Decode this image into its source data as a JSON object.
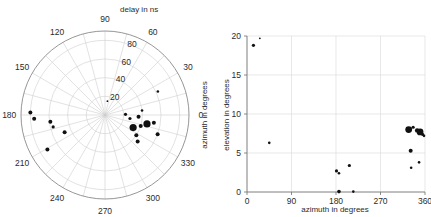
{
  "figure": {
    "background": "#ffffff",
    "marker_color": "#111111",
    "grid_color": "#cfcfcf",
    "axis_color": "#6e6e6e"
  },
  "chart_data": [
    {
      "type": "scatter",
      "projection": "polar",
      "title": "delay in ns",
      "xlabel": "",
      "ylabel": "azimuth in degrees",
      "angle_label": "azimuth in degrees",
      "radial_label": "delay in ns",
      "grid": true,
      "rlim": [
        0,
        90
      ],
      "rticks": [
        20,
        40,
        60,
        80
      ],
      "rtick_labels": [
        "20",
        "40",
        "60",
        "80"
      ],
      "theta_ticks": [
        0,
        30,
        60,
        90,
        120,
        150,
        180,
        210,
        240,
        270,
        300,
        330
      ],
      "theta_tick_labels": [
        "0",
        "30",
        "60",
        "90",
        "120",
        "150",
        "180",
        "210",
        "240",
        "270",
        "300",
        "330"
      ],
      "theta_direction": "counterclockwise",
      "theta_zero_location": "E",
      "points": [
        {
          "theta": 24,
          "r": 62,
          "size": 1.3
        },
        {
          "theta": 7,
          "r": 40,
          "size": 1.3
        },
        {
          "theta": 357,
          "r": 36,
          "size": 2.0
        },
        {
          "theta": 351,
          "r": 53,
          "size": 2.0
        },
        {
          "theta": 348,
          "r": 46,
          "size": 3.6
        },
        {
          "theta": 2,
          "r": 22,
          "size": 1.6
        },
        {
          "theta": 352,
          "r": 27,
          "size": 1.6
        },
        {
          "theta": 343,
          "r": 40,
          "size": 2.0
        },
        {
          "theta": 340,
          "r": 60,
          "size": 2.0
        },
        {
          "theta": 336,
          "r": 33,
          "size": 3.6
        },
        {
          "theta": 327,
          "r": 40,
          "size": 2.0
        },
        {
          "theta": 321,
          "r": 45,
          "size": 2.0
        },
        {
          "theta": 187,
          "r": 59,
          "size": 2.0
        },
        {
          "theta": 183,
          "r": 76,
          "size": 2.0
        },
        {
          "theta": 178,
          "r": 80,
          "size": 2.0
        },
        {
          "theta": 193,
          "r": 57,
          "size": 1.6
        },
        {
          "theta": 203,
          "r": 47,
          "size": 2.0
        },
        {
          "theta": 211,
          "r": 72,
          "size": 2.0
        },
        {
          "theta": 80,
          "r": 15,
          "size": 0.9
        }
      ]
    },
    {
      "type": "scatter",
      "projection": "cartesian",
      "title": "",
      "xlabel": "azimuth in degrees",
      "ylabel": "elevation in degrees",
      "grid": true,
      "xlim": [
        0,
        360
      ],
      "ylim": [
        0,
        20
      ],
      "xticks": [
        0,
        90,
        180,
        270,
        360
      ],
      "xtick_labels": [
        "0",
        "90",
        "180",
        "270",
        "360"
      ],
      "yticks": [
        0,
        5,
        10,
        15,
        20
      ],
      "ytick_labels": [
        "0",
        "5",
        "10",
        "15",
        "20"
      ],
      "points": [
        {
          "x": 13,
          "y": 18.8,
          "size": 1.6
        },
        {
          "x": 26,
          "y": 19.7,
          "size": 0.9
        },
        {
          "x": 45,
          "y": 6.3,
          "size": 1.3
        },
        {
          "x": 181,
          "y": 2.7,
          "size": 1.6
        },
        {
          "x": 186,
          "y": 2.4,
          "size": 1.3
        },
        {
          "x": 186,
          "y": 0.05,
          "size": 1.8
        },
        {
          "x": 207,
          "y": 3.4,
          "size": 1.6
        },
        {
          "x": 215,
          "y": 0.05,
          "size": 1.3
        },
        {
          "x": 327,
          "y": 8.0,
          "size": 3.4
        },
        {
          "x": 336,
          "y": 8.3,
          "size": 1.6
        },
        {
          "x": 344,
          "y": 7.9,
          "size": 2.2
        },
        {
          "x": 350,
          "y": 7.7,
          "size": 3.4
        },
        {
          "x": 355,
          "y": 7.4,
          "size": 1.6
        },
        {
          "x": 358,
          "y": 7.2,
          "size": 1.3
        },
        {
          "x": 331,
          "y": 5.3,
          "size": 2.0
        },
        {
          "x": 332,
          "y": 3.1,
          "size": 1.3
        },
        {
          "x": 348,
          "y": 3.8,
          "size": 1.3
        }
      ]
    }
  ]
}
